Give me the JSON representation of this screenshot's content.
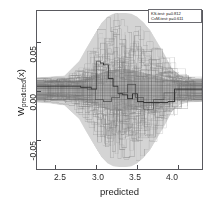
{
  "figure": {
    "background": "#ffffff",
    "frame_color": "#59595e"
  },
  "legend": {
    "lines": [
      "KS-test: p=0.812",
      "CvM-test: p=0.611"
    ],
    "line1": "KS-test: p=0.812",
    "line2": "CvM-test: p=0.611"
  },
  "axes": {
    "xlabel": "predicted",
    "ylabel_main": "W",
    "ylabel_sub": "predicted",
    "ylabel_tail": "(x)",
    "x_ticks": [
      "2.5",
      "3.0",
      "3.5",
      "4.0"
    ],
    "y_ticks": [
      "0.05",
      "0.00",
      "-0.05"
    ]
  },
  "chart_data": {
    "type": "line",
    "title": "",
    "subtitle": "",
    "xlabel": "predicted",
    "ylabel": "W_predicted(x)",
    "xlim": [
      2.28,
      4.32
    ],
    "ylim": [
      -0.082,
      0.082
    ],
    "x_ticks": [
      2.5,
      3.0,
      3.5,
      4.0
    ],
    "y_ticks": [
      -0.05,
      0.0,
      0.05
    ],
    "grid": false,
    "legend_position": "upper right",
    "legend_entries": [
      "KS-test: p=0.812",
      "CvM-test: p=0.611"
    ],
    "annotations": [
      {
        "text": "KS-test: p=0.812",
        "x": 4.05,
        "y": 0.075
      },
      {
        "text": "CvM-test: p=0.611",
        "x": 4.05,
        "y": 0.068
      }
    ],
    "envelope": {
      "name": "band envelope (min/max of all step curves)",
      "x": [
        2.28,
        2.45,
        2.62,
        2.8,
        2.88,
        2.95,
        3.02,
        3.08,
        3.15,
        3.22,
        3.3,
        3.38,
        3.45,
        3.52,
        3.6,
        3.68,
        3.75,
        3.85,
        3.95,
        4.05,
        4.15,
        4.32
      ],
      "upper": [
        0.013,
        0.014,
        0.015,
        0.03,
        0.042,
        0.052,
        0.062,
        0.07,
        0.076,
        0.079,
        0.08,
        0.08,
        0.079,
        0.076,
        0.07,
        0.062,
        0.052,
        0.038,
        0.022,
        0.015,
        0.013,
        0.012
      ],
      "lower": [
        -0.013,
        -0.014,
        -0.016,
        -0.03,
        -0.042,
        -0.052,
        -0.062,
        -0.07,
        -0.076,
        -0.079,
        -0.08,
        -0.08,
        -0.079,
        -0.076,
        -0.07,
        -0.062,
        -0.052,
        -0.038,
        -0.022,
        -0.015,
        -0.013,
        -0.012
      ]
    },
    "core_band": {
      "name": "dense core of overlapping curves near zero",
      "x": [
        2.28,
        2.6,
        2.85,
        3.0,
        3.15,
        3.3,
        3.45,
        3.6,
        3.75,
        3.9,
        4.05,
        4.32
      ],
      "upper": [
        0.009,
        0.009,
        0.011,
        0.016,
        0.02,
        0.022,
        0.021,
        0.018,
        0.015,
        0.011,
        0.009,
        0.008
      ],
      "lower": [
        -0.009,
        -0.009,
        -0.011,
        -0.016,
        -0.02,
        -0.022,
        -0.021,
        -0.018,
        -0.015,
        -0.011,
        -0.009,
        -0.008
      ]
    },
    "series": [
      {
        "name": "highlighted step curve (dark)",
        "type": "step",
        "x": [
          2.28,
          2.6,
          2.82,
          2.95,
          3.02,
          3.06,
          3.1,
          3.16,
          3.22,
          3.28,
          3.34,
          3.4,
          3.46,
          3.52,
          3.6,
          3.7,
          3.8,
          3.9,
          3.98,
          4.1,
          4.32
        ],
        "y": [
          0.004,
          0.004,
          0.003,
          0.001,
          0.03,
          0.028,
          0.026,
          0.012,
          0.004,
          -0.004,
          -0.005,
          -0.009,
          -0.004,
          -0.012,
          -0.013,
          -0.013,
          -0.013,
          -0.012,
          0.001,
          0.001,
          0.001
        ]
      },
      {
        "name": "secondary step curve",
        "type": "step",
        "x": [
          2.28,
          2.7,
          2.9,
          3.0,
          3.1,
          3.2,
          3.3,
          3.4,
          3.5,
          3.6,
          3.72,
          3.85,
          4.0,
          4.32
        ],
        "y": [
          0.002,
          0.002,
          0.001,
          -0.01,
          -0.012,
          -0.008,
          -0.003,
          0.006,
          -0.008,
          -0.02,
          -0.01,
          -0.003,
          0.0,
          0.0
        ]
      }
    ],
    "n_curves_approx": 60,
    "curve_color": "#8c8c8c",
    "band_fill": "#b9b9b9",
    "highlight_color": "#2e2e2e"
  }
}
